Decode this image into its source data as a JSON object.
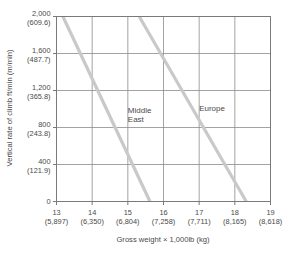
{
  "chart_data": {
    "type": "line",
    "title": "",
    "xlabel": "Gross weight × 1,000lb (kg)",
    "ylabel": "Vertical rate of climb ft/min (m/min)",
    "xlim": [
      13,
      19
    ],
    "ylim": [
      0,
      2000
    ],
    "grid": true,
    "legend_position": "inline-annotation",
    "x_ticks": [
      {
        "primary": "13",
        "secondary": "(5,897)",
        "value": 13
      },
      {
        "primary": "14",
        "secondary": "(6,350)",
        "value": 14
      },
      {
        "primary": "15",
        "secondary": "(6,804)",
        "value": 15
      },
      {
        "primary": "16",
        "secondary": "(7,258)",
        "value": 16
      },
      {
        "primary": "17",
        "secondary": "(7,711)",
        "value": 17
      },
      {
        "primary": "18",
        "secondary": "(8,165)",
        "value": 18
      },
      {
        "primary": "19",
        "secondary": "(8,618)",
        "value": 19
      }
    ],
    "y_ticks": [
      {
        "primary": "2,000",
        "secondary": "(609.6)",
        "value": 2000
      },
      {
        "primary": "1,600",
        "secondary": "(487.7)",
        "value": 1600
      },
      {
        "primary": "1,200",
        "secondary": "(365.8)",
        "value": 1200
      },
      {
        "primary": "800",
        "secondary": "(243.8)",
        "value": 800
      },
      {
        "primary": "400",
        "secondary": "(121.9)",
        "value": 400
      },
      {
        "primary": "0",
        "secondary": "",
        "value": 0
      }
    ],
    "series": [
      {
        "name": "Middle East",
        "color": "#c9c9c9",
        "label_x": 15.0,
        "label_y": 960,
        "points": [
          [
            13.18,
            2000
          ],
          [
            15.62,
            0
          ]
        ]
      },
      {
        "name": "Europe",
        "color": "#c9c9c9",
        "label_x": 17.0,
        "label_y": 980,
        "points": [
          [
            15.32,
            2000
          ],
          [
            18.32,
            0
          ]
        ]
      }
    ]
  },
  "labels": {
    "middle_east_line1": "Middle",
    "middle_east_line2": "East",
    "europe": "Europe"
  }
}
